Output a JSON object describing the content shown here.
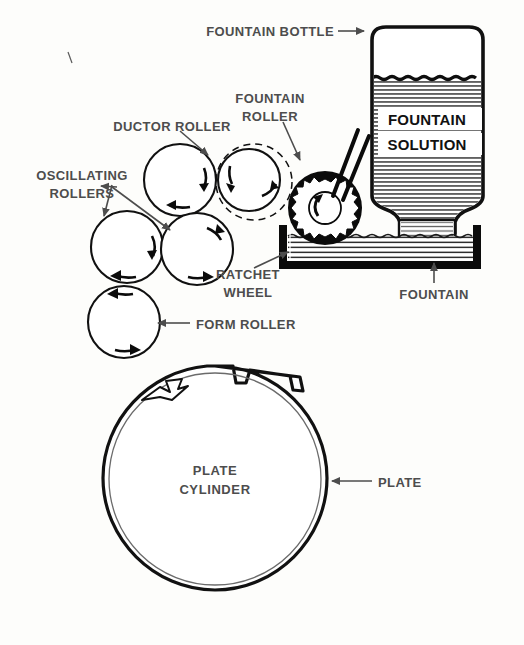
{
  "figure": {
    "background_color": "#fdfdfb",
    "label_color": "#4d4d4d",
    "line_color": "#111111"
  },
  "labels": {
    "fountain_bottle": "FOUNTAIN BOTTLE",
    "fountain_roller_line1": "FOUNTAIN",
    "fountain_roller_line2": "ROLLER",
    "ductor_roller": "DUCTOR ROLLER",
    "oscillating_line1": "OSCILLATING",
    "oscillating_line2": "ROLLERS",
    "ratchet_line1": "RATCHET",
    "ratchet_line2": "WHEEL",
    "form_roller": "FORM ROLLER",
    "fountain": "FOUNTAIN",
    "plate": "PLATE",
    "plate_cylinder_line1": "PLATE",
    "plate_cylinder_line2": "CYLINDER",
    "fountain_solution_line1": "FOUNTAIN",
    "fountain_solution_line2": "SOLUTION"
  },
  "parts": {
    "ductor_roller": {
      "cx": 180,
      "cy": 180,
      "r": 35
    },
    "fountain_roller": {
      "cx": 252,
      "cy": 181,
      "r": 29,
      "dashed_r": 38
    },
    "oscillating_roller_left": {
      "cx": 127,
      "cy": 246,
      "r": 35
    },
    "oscillating_roller_right": {
      "cx": 196,
      "cy": 248,
      "r": 35
    },
    "form_roller": {
      "cx": 124,
      "cy": 321,
      "r": 35
    },
    "ratchet_wheel": {
      "cx": 325,
      "cy": 208,
      "r_outer": 37,
      "r_teeth": 29,
      "r_hub": 16,
      "teeth": 16
    },
    "plate_cylinder": {
      "cx": 215,
      "cy": 478,
      "r": 112
    },
    "bottle": {
      "x": 365,
      "y": 27,
      "width": 125,
      "height": 185,
      "liquid_top_y": 77
    },
    "fountain_pan": {
      "x": 280,
      "y": 228,
      "width": 200,
      "height": 42
    }
  }
}
